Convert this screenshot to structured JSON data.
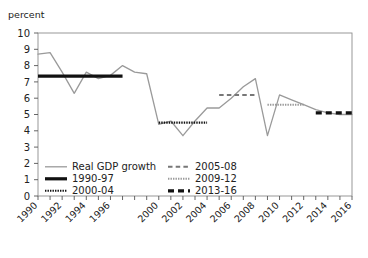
{
  "chart_data": {
    "type": "line",
    "title": "",
    "ylabel": "percent",
    "xlabel": "",
    "ylim": [
      0,
      10
    ],
    "xlim": [
      1990,
      2016
    ],
    "y_ticks": [
      0,
      1,
      2,
      3,
      4,
      5,
      6,
      7,
      8,
      9,
      10
    ],
    "y_tick_labels": [
      "0",
      "1",
      "2",
      "3",
      "4",
      "5",
      "6",
      "7",
      "8",
      "9",
      "10"
    ],
    "x_ticks": [
      1990,
      1991,
      1992,
      1993,
      1994,
      1995,
      1996,
      1997,
      1998,
      1999,
      2000,
      2001,
      2002,
      2003,
      2004,
      2005,
      2006,
      2007,
      2008,
      2009,
      2010,
      2011,
      2012,
      2013,
      2014,
      2015,
      2016
    ],
    "x_tick_labels": [
      "1990",
      "1992",
      "1994",
      "1996",
      "2000",
      "2002",
      "2004",
      "2006",
      "2008",
      "2010",
      "2012",
      "2014",
      "2016"
    ],
    "x_tick_label_years": [
      1990,
      1992,
      1994,
      1996,
      2000,
      2002,
      2004,
      2006,
      2008,
      2010,
      2012,
      2014,
      2016
    ],
    "grid": false,
    "legend_position": "inside-bottom-left",
    "series": [
      {
        "name": "Real GDP growth",
        "style": "solid-thin",
        "color": "#9a9a9a",
        "x": [
          1990,
          1991,
          1992,
          1993,
          1994,
          1995,
          1996,
          1997,
          1998,
          1999,
          2000,
          2001,
          2002,
          2003,
          2004,
          2005,
          2006,
          2007,
          2008,
          2009,
          2010,
          2011,
          2012,
          2013,
          2014,
          2015,
          2016
        ],
        "values": [
          8.7,
          8.8,
          7.6,
          6.3,
          7.6,
          7.2,
          7.4,
          8.0,
          7.6,
          7.5,
          4.4,
          4.6,
          3.7,
          4.6,
          5.4,
          5.4,
          6.0,
          6.7,
          7.2,
          3.7,
          6.2,
          5.9,
          5.6,
          5.3,
          5.1,
          5.0,
          5.0
        ]
      }
    ],
    "average_segments": [
      {
        "name": "1990-97",
        "style": "solid-thick",
        "color": "#111111",
        "x_start": 1990,
        "x_end": 1997,
        "value": 7.35
      },
      {
        "name": "2000-04",
        "style": "dotted-fine",
        "color": "#111111",
        "x_start": 2000,
        "x_end": 2004,
        "value": 4.5
      },
      {
        "name": "2005-08",
        "style": "dashed-medium",
        "color": "#777777",
        "x_start": 2005,
        "x_end": 2008,
        "value": 6.2
      },
      {
        "name": "2009-12",
        "style": "dotted-fine-gray",
        "color": "#9a9a9a",
        "x_start": 2009,
        "x_end": 2012,
        "value": 5.6
      },
      {
        "name": "2013-16",
        "style": "dashed-thick",
        "color": "#111111",
        "x_start": 2013,
        "x_end": 2016,
        "value": 5.1
      }
    ],
    "legend": [
      {
        "label": "Real GDP growth",
        "style": "solid-thin",
        "color": "#9a9a9a"
      },
      {
        "label": "1990-97",
        "style": "solid-thick",
        "color": "#111111"
      },
      {
        "label": "2000-04",
        "style": "dotted-fine",
        "color": "#111111"
      },
      {
        "label": "2005-08",
        "style": "dashed-medium",
        "color": "#777777"
      },
      {
        "label": "2009-12",
        "style": "dotted-fine-gray",
        "color": "#9a9a9a"
      },
      {
        "label": "2013-16",
        "style": "dashed-thick",
        "color": "#111111"
      }
    ]
  },
  "axis": {
    "unit_label": "percent"
  },
  "colors": {
    "series_line": "#9a9a9a",
    "accent_dark": "#111111",
    "axis": "#555555",
    "plot_border": "#8d8d8d",
    "background": "#ffffff"
  }
}
